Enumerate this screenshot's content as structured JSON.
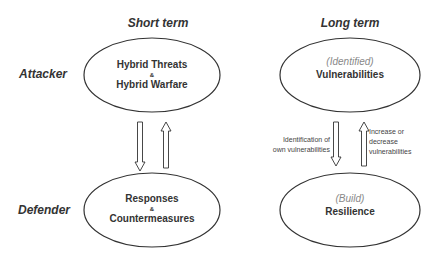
{
  "columns": {
    "short_term": "Short term",
    "long_term": "Long term"
  },
  "rows": {
    "attacker": "Attacker",
    "defender": "Defender"
  },
  "nodes": {
    "hybrid": {
      "line1": "Hybrid Threats",
      "amp": "&",
      "line2": "Hybrid Warfare"
    },
    "responses": {
      "line1": "Responses",
      "amp": "&",
      "line2": "Countermeasures"
    },
    "vulnerabilities": {
      "qualifier": "(Identified)",
      "label": "Vulnerabilities"
    },
    "resilience": {
      "qualifier": "(Build)",
      "label": "Resilience"
    }
  },
  "edges": {
    "down_right_label": [
      "Identification of",
      "own vulnerabilities"
    ],
    "up_right_label": [
      "Increase or",
      "decrease",
      "vulnerabilities"
    ]
  }
}
